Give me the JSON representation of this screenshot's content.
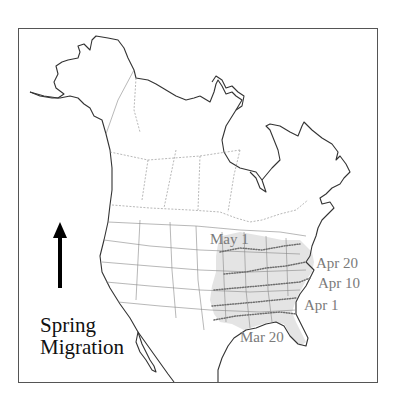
{
  "map": {
    "title_line1": "Spring",
    "title_line2": "Migration",
    "arrow_icon": "up-arrow-icon",
    "region": "North America",
    "colors": {
      "range_fill": "#e4e4e4",
      "isochrone_line": "#6e6e6e",
      "label_text": "#7a7a7a",
      "coastline": "#333333",
      "border": "#888888"
    },
    "isochrones": [
      {
        "label": "May 1"
      },
      {
        "label": "Apr 20"
      },
      {
        "label": "Apr 10"
      },
      {
        "label": "Apr 1"
      },
      {
        "label": "Mar 20"
      }
    ]
  }
}
